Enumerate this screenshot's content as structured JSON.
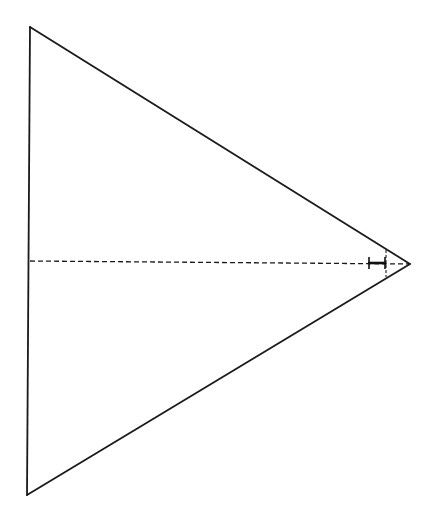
{
  "diagram": {
    "type": "triangle-geometry",
    "colors": {
      "background": "#ffffff",
      "stroke": "#1a1a1a"
    },
    "triangle": {
      "vertices": {
        "top": [
          30,
          27
        ],
        "bottom": [
          27,
          495
        ],
        "apex": [
          410,
          264
        ]
      }
    },
    "median_line": {
      "style": "dashed",
      "from": [
        30,
        261
      ],
      "to": [
        410,
        264
      ]
    },
    "perpendicular_line": {
      "style": "dashed",
      "from": [
        386,
        250
      ],
      "to": [
        386,
        277
      ]
    },
    "dimension_marker": {
      "from": [
        368,
        263
      ],
      "to": [
        386,
        263
      ],
      "end_ticks": true
    }
  }
}
